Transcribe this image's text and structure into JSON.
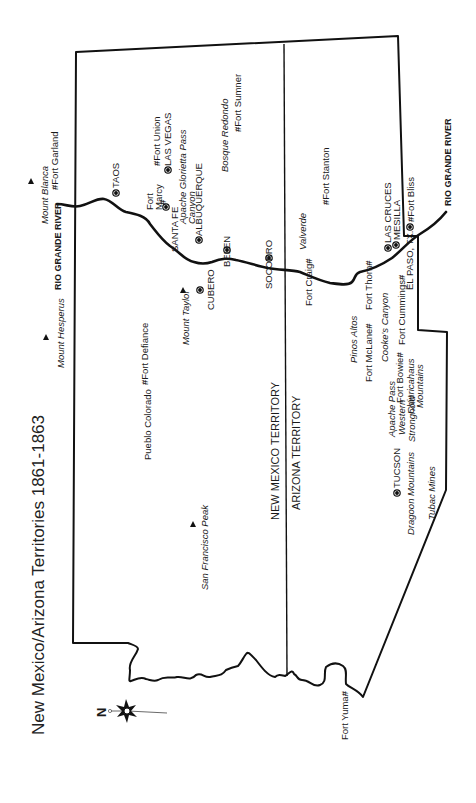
{
  "title": "New Mexico/Arizona Territories 1861-1863",
  "compass": {
    "label": "N"
  },
  "colors": {
    "line": "#111111",
    "background": "#ffffff"
  },
  "territories": {
    "new_mexico": "NEW MEXICO TERRITORY",
    "arizona": "ARIZONA TERRITORY"
  },
  "rivers": {
    "rio_grande_north": "RIO GRANDE RIVER",
    "rio_grande_south": "RIO GRANDE RIVER"
  },
  "towns": [
    {
      "name": "TAOS",
      "symbol": "town"
    },
    {
      "name": "LAS VEGAS",
      "symbol": "town"
    },
    {
      "name": "SANTA FE",
      "symbol": "town"
    },
    {
      "name": "ALBUQUERQUE",
      "symbol": "town"
    },
    {
      "name": "BELEN",
      "symbol": "town"
    },
    {
      "name": "CUBERO",
      "symbol": "town"
    },
    {
      "name": "SOCORRO",
      "symbol": "town"
    },
    {
      "name": "LAS CRUCES",
      "symbol": "town"
    },
    {
      "name": "MESILLA",
      "symbol": "town"
    },
    {
      "name": "EL PASO, TX.",
      "symbol": "town"
    },
    {
      "name": "TUCSON",
      "symbol": "town"
    }
  ],
  "forts": [
    {
      "name": "Fort Garland"
    },
    {
      "name": "Fort Union"
    },
    {
      "name": "Fort Marcy"
    },
    {
      "name": "Fort Sumner"
    },
    {
      "name": "Fort Stanton"
    },
    {
      "name": "Fort Bliss"
    },
    {
      "name": "Fort Craig"
    },
    {
      "name": "Fort Thorn"
    },
    {
      "name": "Fort Cummings"
    },
    {
      "name": "Fort McLane"
    },
    {
      "name": "Fort Bowie"
    },
    {
      "name": "Fort Defiance"
    },
    {
      "name": "Fort Yuma"
    }
  ],
  "mountains": [
    {
      "name": "Mount Blanca"
    },
    {
      "name": "Mount Hesperus"
    },
    {
      "name": "Mount Taylor"
    },
    {
      "name": "San Francisco Peak"
    }
  ],
  "places": [
    {
      "name": "Apache Glorietta Pass"
    },
    {
      "name": "Canyon"
    },
    {
      "name": "Bosque Redondo"
    },
    {
      "name": "Valverde"
    },
    {
      "name": "Pinos Altos"
    },
    {
      "name": "Cooke's Canyon"
    },
    {
      "name": "Apache Pass"
    },
    {
      "name": "Western"
    },
    {
      "name": "Stronghold"
    },
    {
      "name": "Chiuricahaus"
    },
    {
      "name": "Mountains"
    },
    {
      "name": "Dragoon Mountains"
    },
    {
      "name": "Tubac Mines"
    },
    {
      "name": "Pueblo Colorado"
    }
  ]
}
